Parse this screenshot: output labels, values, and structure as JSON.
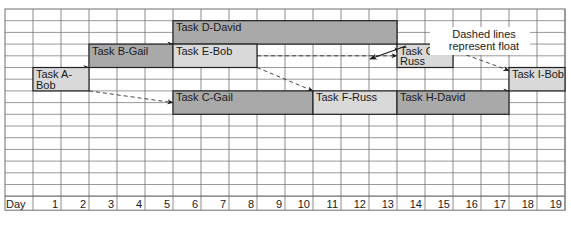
{
  "chart_data": {
    "type": "gantt",
    "title": "",
    "xlabel": "Day",
    "days": [
      1,
      2,
      3,
      4,
      5,
      6,
      7,
      8,
      9,
      10,
      11,
      12,
      13,
      14,
      15,
      16,
      17,
      18,
      19
    ],
    "tasks": [
      {
        "id": "A",
        "label": "Task A-Bob",
        "lines": [
          "Task A-",
          "Bob"
        ],
        "owner": "Bob",
        "start": 1,
        "end": 2,
        "row": 5,
        "shade": "light"
      },
      {
        "id": "B",
        "label": "Task B-Gail",
        "lines": [
          "Task B-Gail"
        ],
        "owner": "Gail",
        "start": 3,
        "end": 5,
        "row": 3,
        "shade": "dark"
      },
      {
        "id": "C",
        "label": "Task C-Gail",
        "lines": [
          "Task C-Gail"
        ],
        "owner": "Gail",
        "start": 6,
        "end": 10,
        "row": 7,
        "shade": "dark"
      },
      {
        "id": "D",
        "label": "Task D-David",
        "lines": [
          "Task D-David"
        ],
        "owner": "David",
        "start": 6,
        "end": 13,
        "row": 1,
        "shade": "dark"
      },
      {
        "id": "E",
        "label": "Task E-Bob",
        "lines": [
          "Task E-Bob"
        ],
        "owner": "Bob",
        "start": 6,
        "end": 8,
        "row": 3,
        "shade": "light"
      },
      {
        "id": "F",
        "label": "Task F-Russ",
        "lines": [
          "Task F-Russ"
        ],
        "owner": "Russ",
        "start": 11,
        "end": 13,
        "row": 7,
        "shade": "light"
      },
      {
        "id": "G",
        "label": "Task G-Russ",
        "lines": [
          "Task G-",
          "Russ"
        ],
        "owner": "Russ",
        "start": 14,
        "end": 15,
        "row": 3,
        "shade": "light"
      },
      {
        "id": "H",
        "label": "Task H-David",
        "lines": [
          "Task H-David"
        ],
        "owner": "David",
        "start": 14,
        "end": 17,
        "row": 7,
        "shade": "dark"
      },
      {
        "id": "I",
        "label": "Task I-Bob",
        "lines": [
          "Task I-Bob"
        ],
        "owner": "Bob",
        "start": 18,
        "end": 19,
        "row": 5,
        "shade": "light"
      }
    ],
    "dependencies": [
      {
        "from": "A",
        "to": "B",
        "style": "solid"
      },
      {
        "from": "A",
        "to": "C",
        "style": "dashed"
      },
      {
        "from": "B",
        "to": "D",
        "style": "solid"
      },
      {
        "from": "B",
        "to": "E",
        "style": "solid"
      },
      {
        "from": "C",
        "to": "F",
        "style": "solid"
      },
      {
        "from": "D",
        "to": "G",
        "style": "dashed"
      },
      {
        "from": "E",
        "to": "G",
        "style": "dashed"
      },
      {
        "from": "E",
        "to": "F",
        "style": "dashed"
      },
      {
        "from": "F",
        "to": "H",
        "style": "solid"
      },
      {
        "from": "G",
        "to": "I",
        "style": "dashed"
      },
      {
        "from": "H",
        "to": "I",
        "style": "solid"
      }
    ],
    "annotations": [
      {
        "text": "Dashed lines represent float",
        "lines": [
          "Dashed lines",
          "represent float"
        ]
      }
    ],
    "grid": true
  },
  "axis": {
    "label": "Day"
  },
  "annotation": {
    "line1": "Dashed lines",
    "line2": "represent float"
  },
  "colors": {
    "dark_bar": "#a9a9a9",
    "light_bar": "#d9d9d9",
    "grid": "#6e6e6e",
    "text": "#1a1a1a"
  }
}
